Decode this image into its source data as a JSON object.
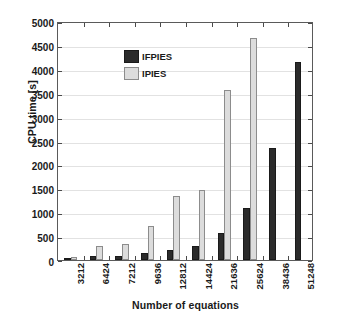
{
  "chart_data": {
    "type": "bar",
    "title": "",
    "xlabel": "Number of equations",
    "ylabel": "CPU time [s]",
    "categories": [
      "3212",
      "6424",
      "7212",
      "9636",
      "12812",
      "14424",
      "21636",
      "25624",
      "38436",
      "51248"
    ],
    "series": [
      {
        "name": "IFPIES",
        "color": "#2b2b2b",
        "values": [
          25,
          80,
          90,
          150,
          210,
          290,
          570,
          1095,
          2340,
          4135
        ]
      },
      {
        "name": "IPIES",
        "color": "#dcdcdc",
        "values": [
          60,
          295,
          340,
          705,
          1340,
          1465,
          3555,
          4655,
          null,
          null
        ]
      }
    ],
    "ylim": [
      0,
      5000
    ],
    "yticks": [
      0,
      500,
      1000,
      1500,
      2000,
      2500,
      3000,
      3500,
      4000,
      4500,
      5000
    ],
    "ytick_labels": [
      "0",
      "500",
      "1000",
      "1500",
      "2000",
      "2500",
      "3000",
      "3500",
      "4000",
      "4500",
      "5000"
    ],
    "grid": true,
    "legend_position": "top-left",
    "legend": [
      "IFPIES",
      "IPIES"
    ]
  }
}
